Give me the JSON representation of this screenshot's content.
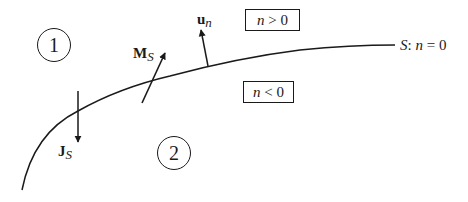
{
  "diagram": {
    "type": "interface-boundary",
    "surface": {
      "name": "S",
      "label": "S: n = 0",
      "label_parts": {
        "name": "S",
        "sep": ":",
        "var": "n",
        "rest": " = 0"
      }
    },
    "regions": [
      {
        "id": "1",
        "label": "1"
      },
      {
        "id": "2",
        "label": "2"
      }
    ],
    "boxes": [
      {
        "id": "n-positive",
        "var": "n",
        "rest": " > 0"
      },
      {
        "id": "n-negative",
        "var": "n",
        "rest": " < 0"
      }
    ],
    "vectors": [
      {
        "id": "u_n",
        "symbol": "u",
        "subscript": "n",
        "description": "unit normal"
      },
      {
        "id": "M_S",
        "symbol": "M",
        "subscript": "S",
        "description": "surface magnetic current"
      },
      {
        "id": "J_S",
        "symbol": "J",
        "subscript": "S",
        "description": "surface electric current"
      }
    ],
    "colors": {
      "stroke": "#1a1a1a",
      "background": "#ffffff"
    }
  }
}
